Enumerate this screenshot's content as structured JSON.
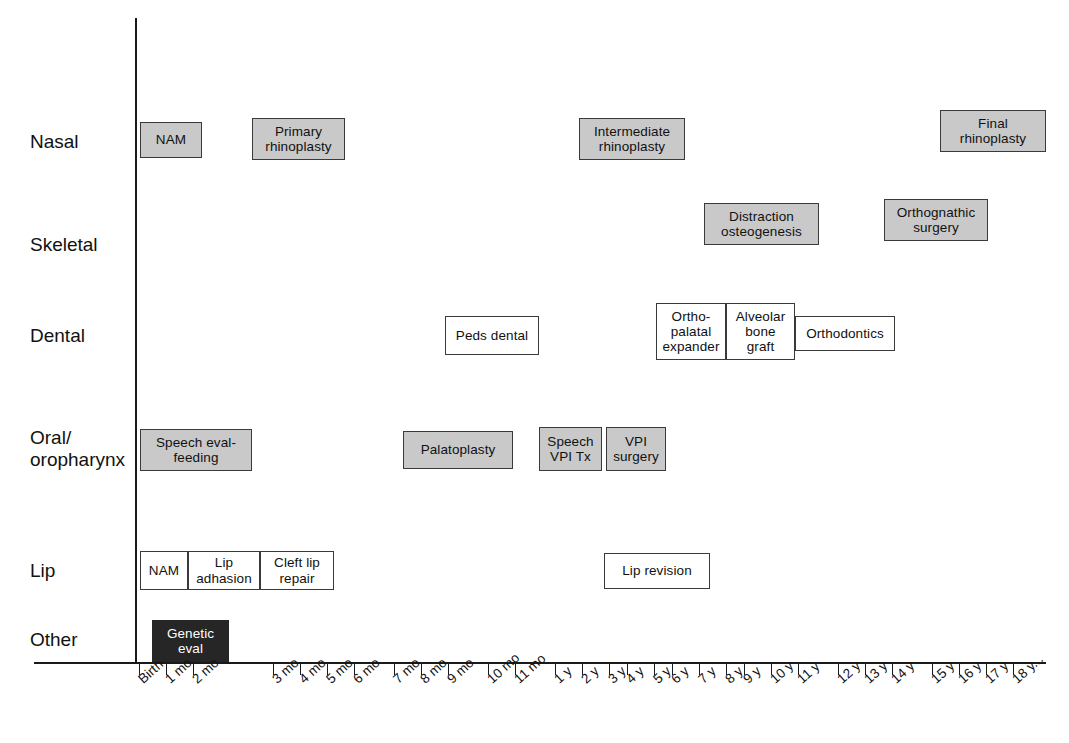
{
  "chart_data": {
    "type": "timeline",
    "xlabel": "",
    "ylabel": "",
    "grid": false,
    "legend": "none",
    "axis": {
      "x_ticks": [
        {
          "label": "Birth",
          "x": 139
        },
        {
          "label": "1 mo",
          "x": 166
        },
        {
          "label": "2 mo",
          "x": 193
        },
        {
          "label": "3 mo",
          "x": 273
        },
        {
          "label": "4 mo",
          "x": 300
        },
        {
          "label": "5 mo",
          "x": 327
        },
        {
          "label": "6 mo",
          "x": 354
        },
        {
          "label": "7 mo",
          "x": 394
        },
        {
          "label": "8 mo",
          "x": 421
        },
        {
          "label": "9 mo",
          "x": 448
        },
        {
          "label": "10 mo",
          "x": 488
        },
        {
          "label": "11 mo",
          "x": 515
        },
        {
          "label": "1 y",
          "x": 555
        },
        {
          "label": "2 y",
          "x": 582
        },
        {
          "label": "3 y",
          "x": 609
        },
        {
          "label": "4 y",
          "x": 627
        },
        {
          "label": "5 y",
          "x": 654
        },
        {
          "label": "6 y",
          "x": 672
        },
        {
          "label": "7 y",
          "x": 699
        },
        {
          "label": "8 y",
          "x": 726
        },
        {
          "label": "9 y",
          "x": 744
        },
        {
          "label": "10 y",
          "x": 771
        },
        {
          "label": "11 y",
          "x": 798
        },
        {
          "label": "12 y",
          "x": 838
        },
        {
          "label": "13 y",
          "x": 865
        },
        {
          "label": "14 y",
          "x": 892
        },
        {
          "label": "15 y",
          "x": 932
        },
        {
          "label": "16 y",
          "x": 959
        },
        {
          "label": "17 y",
          "x": 986
        },
        {
          "label": "18 y...",
          "x": 1013
        }
      ]
    },
    "rows": [
      {
        "name": "Nasal",
        "label": "Nasal",
        "label_y": 131,
        "items": [
          {
            "text": "NAM",
            "x": 140,
            "y": 122,
            "w": 62,
            "h": 36,
            "fill": "gray"
          },
          {
            "text": "Primary\nrhinoplasty",
            "x": 252,
            "y": 118,
            "w": 93,
            "h": 42,
            "fill": "gray"
          },
          {
            "text": "Intermediate\nrhinoplasty",
            "x": 579,
            "y": 118,
            "w": 106,
            "h": 42,
            "fill": "gray"
          },
          {
            "text": "Final\nrhinoplasty",
            "x": 940,
            "y": 110,
            "w": 106,
            "h": 42,
            "fill": "gray"
          }
        ]
      },
      {
        "name": "Skeletal",
        "label": "Skeletal",
        "label_y": 234,
        "items": [
          {
            "text": "Distraction\nosteogenesis",
            "x": 704,
            "y": 203,
            "w": 115,
            "h": 42,
            "fill": "gray"
          },
          {
            "text": "Orthognathic\nsurgery",
            "x": 884,
            "y": 199,
            "w": 104,
            "h": 42,
            "fill": "gray"
          }
        ]
      },
      {
        "name": "Dental",
        "label": "Dental",
        "label_y": 325,
        "items": [
          {
            "text": "Peds dental",
            "x": 445,
            "y": 316,
            "w": 94,
            "h": 39,
            "fill": "white"
          },
          {
            "text": "Ortho-\npalatal\nexpander",
            "x": 656,
            "y": 303,
            "w": 70,
            "h": 57,
            "fill": "white"
          },
          {
            "text": "Alveolar\nbone\ngraft",
            "x": 726,
            "y": 303,
            "w": 69,
            "h": 57,
            "fill": "white"
          },
          {
            "text": "Orthodontics",
            "x": 795,
            "y": 316,
            "w": 100,
            "h": 35,
            "fill": "white"
          }
        ]
      },
      {
        "name": "Oral/oropharynx",
        "label": "Oral/\noropharynx",
        "label_y": 427,
        "items": [
          {
            "text": "Speech eval-\nfeeding",
            "x": 140,
            "y": 429,
            "w": 112,
            "h": 42,
            "fill": "gray"
          },
          {
            "text": "Palatoplasty",
            "x": 403,
            "y": 431,
            "w": 110,
            "h": 38,
            "fill": "gray"
          },
          {
            "text": "Speech\nVPI Tx",
            "x": 539,
            "y": 427,
            "w": 63,
            "h": 44,
            "fill": "gray"
          },
          {
            "text": "VPI\nsurgery",
            "x": 606,
            "y": 427,
            "w": 60,
            "h": 44,
            "fill": "gray"
          }
        ]
      },
      {
        "name": "Lip",
        "label": "Lip",
        "label_y": 560,
        "items": [
          {
            "text": "NAM",
            "x": 140,
            "y": 551,
            "w": 48,
            "h": 39,
            "fill": "white"
          },
          {
            "text": "Lip\nadhasion",
            "x": 188,
            "y": 551,
            "w": 72,
            "h": 39,
            "fill": "white"
          },
          {
            "text": "Cleft lip\nrepair",
            "x": 260,
            "y": 551,
            "w": 74,
            "h": 39,
            "fill": "white"
          },
          {
            "text": "Lip revision",
            "x": 604,
            "y": 553,
            "w": 106,
            "h": 36,
            "fill": "white"
          }
        ]
      },
      {
        "name": "Other",
        "label": "Other",
        "label_y": 629,
        "items": [
          {
            "text": "Genetic\neval",
            "x": 152,
            "y": 620,
            "w": 77,
            "h": 42,
            "fill": "dark"
          }
        ]
      }
    ]
  }
}
